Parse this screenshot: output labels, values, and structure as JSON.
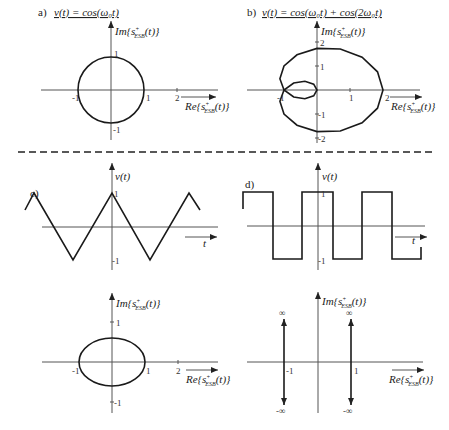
{
  "divider": {
    "style": "dashed"
  },
  "panels": {
    "a": {
      "label": "a)",
      "title": "v(t) = cos(ω₀t)",
      "x_axis_label": "Re{s⁺ESB(t)}",
      "y_axis_label": "Im{s⁺ESB(t)}",
      "x_ticks": [
        "-1",
        "1",
        "2"
      ],
      "y_ticks": [
        "1",
        "-1"
      ],
      "curve": "circle radius 1"
    },
    "b": {
      "label": "b)",
      "title": "v(t) = cos(ω₀t) + cos(2ω₀t)",
      "x_axis_label": "Re{s⁺ESB(t)}",
      "y_axis_label": "Im{s⁺ESB(t)}",
      "x_ticks": [
        "-1",
        "1",
        "2"
      ],
      "y_ticks": [
        "2",
        "1",
        "-1",
        "-2"
      ],
      "curve": "limaçon with inner loop"
    },
    "c": {
      "label": "c)",
      "y_axis_label": "v(t)",
      "x_axis_label": "t",
      "y_ticks": [
        "1",
        "-1"
      ],
      "curve": "triangle wave"
    },
    "d": {
      "label": "d)",
      "y_axis_label": "v(t)",
      "x_axis_label": "t",
      "y_ticks": [
        "1",
        "-1"
      ],
      "curve": "square wave"
    },
    "e": {
      "x_axis_label": "Re{s⁺ESB(t)}",
      "y_axis_label": "Im{s⁺ESB(t)}",
      "x_ticks": [
        "-1",
        "1",
        "2"
      ],
      "y_ticks": [
        "1",
        "-1"
      ],
      "curve": "ellipse"
    },
    "f": {
      "x_axis_label": "Re{s⁺ESB(t)}",
      "y_axis_label": "Im{s⁺ESB(t)}",
      "x_ticks": [
        "-1",
        "1"
      ],
      "top_marks": [
        "∞",
        "∞"
      ],
      "bottom_marks": [
        "-∞",
        "-∞"
      ],
      "curve": "two vertical lines to ±infinity"
    }
  },
  "text": {
    "a_label": "a)",
    "a_title": "v(t) = cos(ω₀t)",
    "b_label": "b)",
    "b_title": "v(t) = cos(ω₀t) + cos(2ω₀t)",
    "c_label": "c)",
    "d_label": "d)",
    "re": "Re",
    "im": "Im",
    "s": "s",
    "sup": "+",
    "subs": "ESB",
    "arg": "(t)}",
    "lbrace": "{",
    "vt": "v(t)",
    "t": "t",
    "one": "1",
    "neg_one": "-1",
    "two": "2",
    "neg_two": "-2",
    "inf": "∞",
    "neg_inf": "-∞"
  }
}
